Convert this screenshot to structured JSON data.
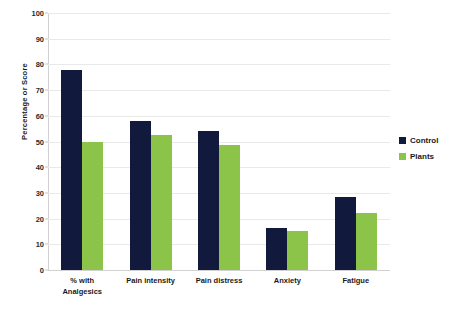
{
  "chart_data": {
    "type": "bar",
    "title": "",
    "subtitle": "",
    "xlabel": "",
    "ylabel": "Percentage or Score",
    "categories": [
      "% with Analgesics",
      "Pain intensity",
      "Pain distress",
      "Anxiety",
      "Fatigue"
    ],
    "category_lines": [
      [
        "% with",
        "Analgesics"
      ],
      [
        "Pain intensity"
      ],
      [
        "Pain distress"
      ],
      [
        "Anxiety"
      ],
      [
        "Fatigue"
      ]
    ],
    "series": [
      {
        "name": "Control",
        "color": "#111a3d",
        "values": [
          78,
          58,
          54,
          16.5,
          28.5
        ]
      },
      {
        "name": "Plants",
        "color": "#8cc44a",
        "values": [
          50,
          52.5,
          48.5,
          15,
          22
        ]
      }
    ],
    "ylim": [
      0,
      100
    ],
    "yticks": [
      0,
      10,
      20,
      30,
      40,
      50,
      60,
      70,
      80,
      90,
      100
    ],
    "ytick_labels": [
      "0",
      "10",
      "20",
      "30",
      "40",
      "50",
      "60",
      "70",
      "80",
      "90",
      "100"
    ],
    "grid": true,
    "grid_axis": "y",
    "grid_color": "#e9e9e9",
    "legend_position": "right",
    "background_color": "#ffffff"
  },
  "legend": {
    "items": [
      {
        "label": "Control",
        "color": "#111a3d"
      },
      {
        "label": "Plants",
        "color": "#8cc44a"
      }
    ]
  }
}
